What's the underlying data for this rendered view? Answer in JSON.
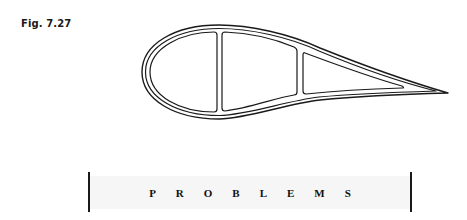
{
  "figure": {
    "label": "Fig. 7.27",
    "stroke_color": "#1a1a1a"
  },
  "section_heading": {
    "text": "PROBLEMS",
    "band_color": "#f6f6f6",
    "rule_color": "#1a1a1a"
  }
}
